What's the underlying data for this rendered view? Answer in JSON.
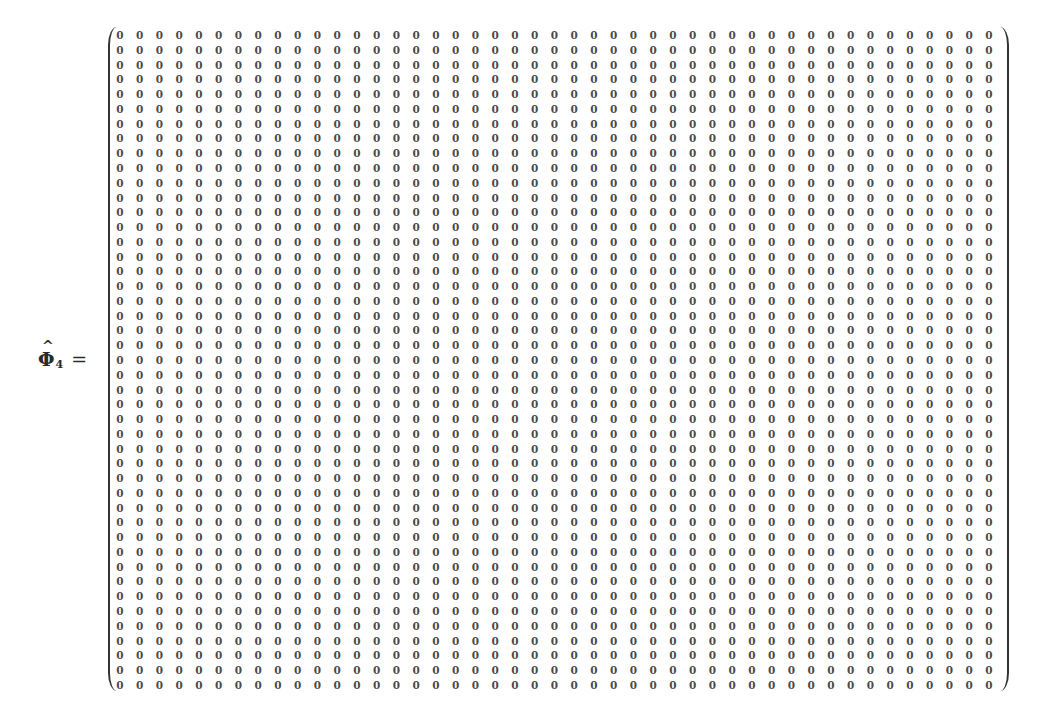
{
  "equation": {
    "symbol": "Φ",
    "hat": "^",
    "subscript": "4",
    "equals": "=",
    "matrix": {
      "rows": 45,
      "columns": 45,
      "fill_value": "0",
      "bracket": "parentheses"
    }
  }
}
